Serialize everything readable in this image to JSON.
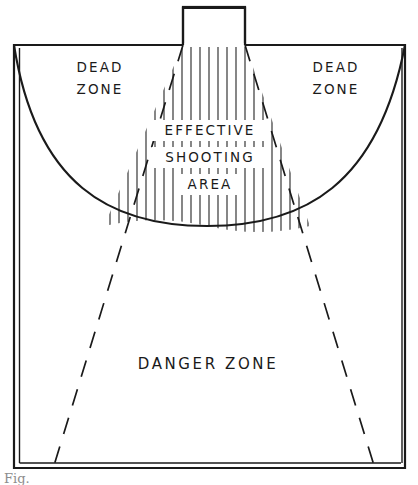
{
  "figure": {
    "caption": "Fig.",
    "background_color": "#ffffff",
    "ink_color": "#1a1a1a"
  },
  "structure": {
    "name": "gun-emplacement",
    "x": 183,
    "y": 7,
    "width": 62,
    "height": 38
  },
  "field": {
    "left": 14,
    "top": 45,
    "right": 405,
    "bottom": 468
  },
  "arc": {
    "description": "maximum-range arc",
    "start_x": 14,
    "start_y": 45,
    "low_x": 207,
    "low_y": 226,
    "end_x": 405,
    "end_y": 45
  },
  "cone": {
    "apex_left_x": 183,
    "apex_right_x": 245,
    "apex_y": 45,
    "base_left_x": 55,
    "base_right_x": 372,
    "base_y": 468
  },
  "labels": {
    "dead_zone_left": {
      "line1": "DEAD",
      "line2": "ZONE",
      "x": 100,
      "y1": 72,
      "y2": 94
    },
    "dead_zone_right": {
      "line1": "DEAD",
      "line2": "ZONE",
      "x": 336,
      "y1": 72,
      "y2": 94
    },
    "effective_shooting_area": {
      "line1": "EFFECTIVE",
      "line2": "SHOOTING",
      "line3": "AREA",
      "x": 209,
      "y1": 133,
      "y2": 161,
      "y3": 188
    },
    "danger_zone": {
      "line1": "DANGER  ZONE",
      "x": 208,
      "y1": 368
    }
  },
  "hatching": {
    "name": "vertical-hatch-fill",
    "count": 22,
    "orientation": "vertical",
    "region": "effective-shooting-area"
  }
}
